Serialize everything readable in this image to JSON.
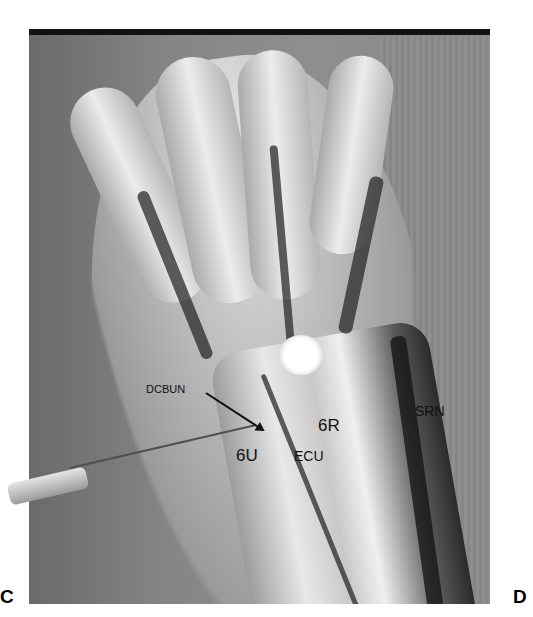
{
  "figure": {
    "labels": {
      "dcbun": "DCBUN",
      "six_r": "6R",
      "six_u": "6U",
      "ecu": "ECU",
      "srn": "SRN"
    },
    "panel_letters": {
      "left": "C",
      "right": "D"
    }
  }
}
